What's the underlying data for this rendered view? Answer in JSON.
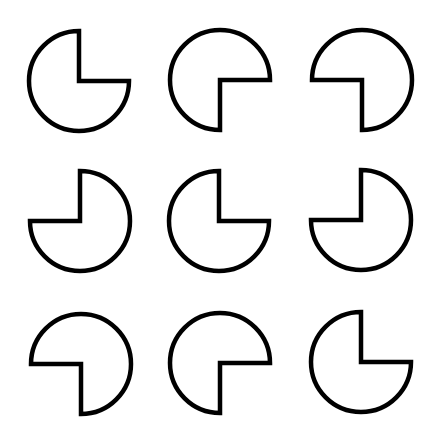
{
  "figure": {
    "width": 439,
    "height": 442,
    "background": "#ffffff",
    "stroke_color": "#000000",
    "fill_color": "#ffffff",
    "stroke_width": 4.5,
    "radius": 50,
    "grid": {
      "rows": 3,
      "cols": 3
    },
    "shapes": [
      {
        "row": 0,
        "col": 0,
        "cx": 79,
        "cy": 81,
        "missing_quadrant": "top-right"
      },
      {
        "row": 0,
        "col": 1,
        "cx": 220,
        "cy": 80,
        "missing_quadrant": "bottom-right"
      },
      {
        "row": 0,
        "col": 2,
        "cx": 362,
        "cy": 80,
        "missing_quadrant": "bottom-left"
      },
      {
        "row": 1,
        "col": 0,
        "cx": 80,
        "cy": 221,
        "missing_quadrant": "top-left"
      },
      {
        "row": 1,
        "col": 1,
        "cx": 219,
        "cy": 221,
        "missing_quadrant": "top-right"
      },
      {
        "row": 1,
        "col": 2,
        "cx": 361,
        "cy": 220,
        "missing_quadrant": "top-left"
      },
      {
        "row": 2,
        "col": 0,
        "cx": 81,
        "cy": 364,
        "missing_quadrant": "bottom-left"
      },
      {
        "row": 2,
        "col": 1,
        "cx": 220,
        "cy": 363,
        "missing_quadrant": "bottom-right"
      },
      {
        "row": 2,
        "col": 2,
        "cx": 361,
        "cy": 362,
        "missing_quadrant": "top-right"
      }
    ]
  }
}
